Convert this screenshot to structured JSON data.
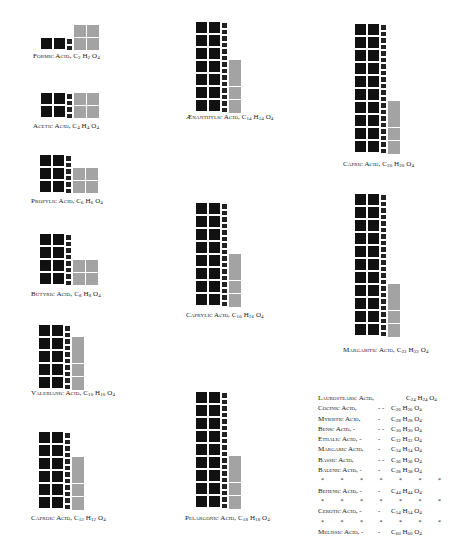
{
  "colors": {
    "carbon": "#111111",
    "hydrogen": "#222222",
    "oxygen": "#a3a3a3",
    "background": "#ffffff"
  },
  "figures": [
    {
      "id": "formic",
      "name": "Formic Acid",
      "C": "2",
      "H": "2",
      "O": "4",
      "x": 41,
      "y": 38,
      "rows": 1,
      "grey": "2x2",
      "lx": 33,
      "ly": 52
    },
    {
      "id": "acetic",
      "name": "Acetic Acid",
      "C": "4",
      "H": "4",
      "O": "4",
      "x": 41,
      "y": 93,
      "rows": 2,
      "grey": "2x2",
      "lx": 33,
      "ly": 122
    },
    {
      "id": "propylic",
      "name": "Propylic Acid",
      "C": "6",
      "H": "6",
      "O": "4",
      "x": 40,
      "y": 155,
      "rows": 3,
      "grey": "2x2",
      "lx": 31,
      "ly": 197
    },
    {
      "id": "butyric",
      "name": "Butyric Acid",
      "C": "8",
      "H": "8",
      "O": "4",
      "x": 40,
      "y": 234,
      "rows": 4,
      "grey": "2x2",
      "lx": 31,
      "ly": 290
    },
    {
      "id": "valerianic",
      "name": "Valerianic Acid",
      "C": "10",
      "H": "10",
      "O": "4",
      "x": 39,
      "y": 325,
      "rows": 5,
      "grey": "col",
      "lx": 31,
      "ly": 389
    },
    {
      "id": "caproic",
      "name": "Caproic Acid",
      "C": "12",
      "H": "12",
      "O": "4",
      "x": 39,
      "y": 432,
      "rows": 6,
      "grey": "col",
      "lx": 31,
      "ly": 514
    },
    {
      "id": "aenanthylic",
      "name": "Ænanthylic Acid",
      "C": "14",
      "H": "14",
      "O": "4",
      "x": 196,
      "y": 22,
      "rows": 7,
      "grey": "col",
      "lx": 186,
      "ly": 113
    },
    {
      "id": "caprylic",
      "name": "Caprylic Acid",
      "C": "16",
      "H": "16",
      "O": "4",
      "x": 196,
      "y": 203,
      "rows": 8,
      "grey": "col",
      "lx": 186,
      "ly": 311
    },
    {
      "id": "pelargonic",
      "name": "Pelargonic Acid",
      "C": "18",
      "H": "18",
      "O": "4",
      "x": 196,
      "y": 392,
      "rows": 9,
      "grey": "col",
      "lx": 185,
      "ly": 514
    },
    {
      "id": "capric",
      "name": "Capric Acid",
      "C": "20",
      "H": "20",
      "O": "4",
      "x": 355,
      "y": 24,
      "rows": 10,
      "grey": "col",
      "lx": 343,
      "ly": 160
    },
    {
      "id": "margaritic",
      "name": "Margaritic Acid",
      "C": "22",
      "H": "22",
      "O": "4",
      "x": 355,
      "y": 194,
      "rows": 11,
      "grey": "col",
      "lx": 343,
      "ly": 346
    }
  ],
  "table": {
    "rows": [
      {
        "type": "acid",
        "name": "Laurostearic Acid,",
        "dashes": "",
        "C": "24",
        "H": "24",
        "O": "4",
        "inline": true
      },
      {
        "type": "acid",
        "name": "Cocinic Acid,",
        "dashes": "-  -",
        "C": "26",
        "H": "26",
        "O": "4"
      },
      {
        "type": "acid",
        "name": "Myristic Acid,",
        "dashes": "-",
        "C": "28",
        "H": "28",
        "O": "4"
      },
      {
        "type": "acid",
        "name": "Benic Acid, -",
        "dashes": "-  -",
        "C": "30",
        "H": "30",
        "O": "4"
      },
      {
        "type": "acid",
        "name": "Ethalic Acid, -",
        "dashes": "-",
        "C": "32",
        "H": "32",
        "O": "4"
      },
      {
        "type": "acid",
        "name": "Margaric Acid,",
        "dashes": "-",
        "C": "34",
        "H": "34",
        "O": "4"
      },
      {
        "type": "acid",
        "name": "Bassic Acid,",
        "dashes": "-  -",
        "C": "36",
        "H": "36",
        "O": "4"
      },
      {
        "type": "acid",
        "name": "Balenic Acid, -",
        "dashes": "-",
        "C": "38",
        "H": "38",
        "O": "4"
      },
      {
        "type": "stars"
      },
      {
        "type": "acid",
        "name": "Behenic Acid, -",
        "dashes": "-",
        "C": "44",
        "H": "44",
        "O": "4"
      },
      {
        "type": "stars"
      },
      {
        "type": "acid",
        "name": "Cerotic Acid, -",
        "dashes": "-",
        "C": "54",
        "H": "54",
        "O": "4"
      },
      {
        "type": "stars"
      },
      {
        "type": "acid",
        "name": "Melissic Acid, -",
        "dashes": "-",
        "C": "60",
        "H": "60",
        "O": "4"
      }
    ],
    "star_glyph": "*",
    "star_count": 7
  },
  "labels": {
    "formic": {
      "name": "Formic Acid,",
      "c": "C",
      "cs": "2",
      "h": "H",
      "hs": "2",
      "o": "O",
      "os": "4"
    },
    "acetic": {
      "name": "Acetic Acid,",
      "c": "C",
      "cs": "4",
      "h": "H",
      "hs": "4",
      "o": "O",
      "os": "4"
    },
    "propylic": {
      "name": "Propylic Acid,",
      "c": "C",
      "cs": "6",
      "h": "H",
      "hs": "6",
      "o": "O",
      "os": "4"
    },
    "butyric": {
      "name": "Butyric Acid,",
      "c": "C",
      "cs": "8",
      "h": "H",
      "hs": "8",
      "o": "O",
      "os": "4"
    },
    "valerianic": {
      "name": "Valerianic Acid,",
      "c": "C",
      "cs": "10",
      "h": "H",
      "hs": "10",
      "o": "O",
      "os": "4"
    },
    "caproic": {
      "name": "Caproic Acid,",
      "c": "C",
      "cs": "12",
      "h": "H",
      "hs": "12",
      "o": "O",
      "os": "4"
    },
    "aenanthylic": {
      "name": "Ænanthylic Acid,",
      "c": "C",
      "cs": "14",
      "h": "H",
      "hs": "14",
      "o": "O",
      "os": "4"
    },
    "caprylic": {
      "name": "Caprylic Acid,",
      "c": "C",
      "cs": "16",
      "h": "H",
      "hs": "16",
      "o": "O",
      "os": "4"
    },
    "pelargonic": {
      "name": "Pelargonic Acid,",
      "c": "C",
      "cs": "18",
      "h": "H",
      "hs": "18",
      "o": "O",
      "os": "4"
    },
    "capric": {
      "name": "Capric Acid,",
      "c": "C",
      "cs": "20",
      "h": "H",
      "hs": "20",
      "o": "O",
      "os": "4"
    },
    "margaritic": {
      "name": "Margaritic Acid,",
      "c": "C",
      "cs": "22",
      "h": "H",
      "hs": "22",
      "o": "O",
      "os": "4"
    }
  }
}
